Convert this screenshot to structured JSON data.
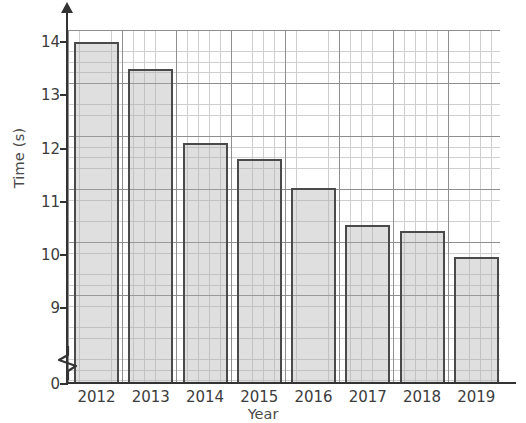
{
  "chart_data": {
    "type": "bar",
    "title": "",
    "xlabel": "Year",
    "ylabel": "Time (s)",
    "categories": [
      "2012",
      "2013",
      "2014",
      "2015",
      "2016",
      "2017",
      "2018",
      "2019"
    ],
    "values": [
      14.0,
      13.5,
      12.1,
      11.8,
      11.25,
      10.55,
      10.45,
      9.95
    ],
    "ylim": [
      9,
      14
    ],
    "y_axis_broken": true,
    "y_break_between": [
      0,
      9
    ],
    "yticks": [
      "0",
      "9",
      "10",
      "11",
      "12",
      "13",
      "14"
    ],
    "ytick_values": [
      0,
      9,
      10,
      11,
      12,
      13,
      14
    ],
    "grid": "major-and-minor",
    "minor_tick_step": 0.2,
    "legend": "none",
    "bar_fill_color": "#d5d5d5",
    "bar_edge_color": "#4a4a4a",
    "grid_major_color": "#8f8f8f",
    "grid_minor_color": "#cfcfcf",
    "axis_color": "#333333"
  },
  "axis_labels": {
    "y_title": "Time (s)",
    "x_title": "Year"
  },
  "icons": {
    "y_axis_arrow": "arrow-up-icon",
    "axis_break": "axis-break-zigzag-icon"
  }
}
